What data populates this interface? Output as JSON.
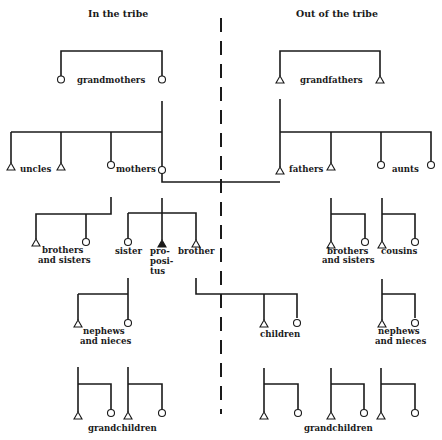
{
  "headers": {
    "left": "In the tribe",
    "right": "Out of the tribe"
  },
  "labels": {
    "grandmothers": "grandmothers",
    "grandfathers": "grandfathers",
    "uncles": "uncles",
    "mothers": "mothers",
    "fathers": "fathers",
    "aunts": "aunts",
    "brothers_sisters_left_1": "brothers",
    "brothers_sisters_left_2": "and sisters",
    "sister": "sister",
    "propositus_1": "pro-",
    "propositus_2": "posi-",
    "propositus_3": "tus",
    "brother": "brother",
    "brothers_sisters_right_1": "brothers",
    "brothers_sisters_right_2": "and sisters",
    "cousins": "cousins",
    "nephews_left_1": "nephews",
    "nephews_left_2": "and nieces",
    "children": "children",
    "nephews_right_1": "nephews",
    "nephews_right_2": "and nieces",
    "grandchildren_left": "grandchildren",
    "grandchildren_right": "grandchildren"
  },
  "legend_symbols": {
    "female": "circle",
    "male": "triangle",
    "ego": "filled-triangle"
  }
}
